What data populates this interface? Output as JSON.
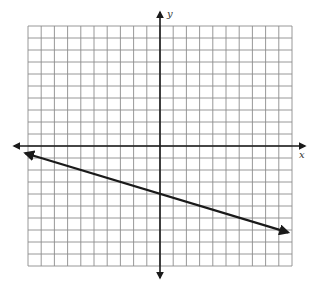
{
  "chart_data": {
    "type": "line",
    "title": "",
    "xlabel": "x",
    "ylabel": "y",
    "xlim": [
      -10,
      10
    ],
    "ylim": [
      -10,
      10
    ],
    "grid": true,
    "grid_step": 1,
    "tick_labels": false,
    "series": [
      {
        "name": "line",
        "equation": "y = -x/3 - 4",
        "slope": -0.3333,
        "y_intercept": -4,
        "x": [
          -10.2,
          -6,
          0,
          3,
          6,
          9.7
        ],
        "y": [
          -0.6,
          -2,
          -4,
          -5,
          -6,
          -7.2
        ],
        "arrows_both_ends": true,
        "color": "#1a1a1a"
      }
    ]
  },
  "style": {
    "grid_color": "#8c8c8c",
    "axis_color": "#1a1a1a",
    "background": "#ffffff"
  },
  "labels": {
    "x_axis": "x",
    "y_axis": "y"
  }
}
